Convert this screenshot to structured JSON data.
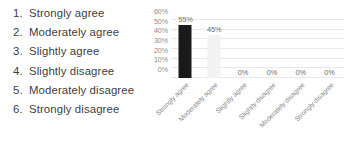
{
  "scale": {
    "items": [
      {
        "num": "1.",
        "label": "Strongly agree"
      },
      {
        "num": "2.",
        "label": "Moderately agree"
      },
      {
        "num": "3.",
        "label": "Slightly agree"
      },
      {
        "num": "4.",
        "label": "Slightly disagree"
      },
      {
        "num": "5.",
        "label": "Moderately disagree"
      },
      {
        "num": "6.",
        "label": "Strongly disagree"
      }
    ]
  },
  "chart_data": {
    "type": "bar",
    "title": "",
    "xlabel": "",
    "ylabel": "",
    "categories": [
      "Strongly agree",
      "Moderately agree",
      "Slightly agree",
      "Slightly disagree",
      "Moderately disagree",
      "Strongly disagree"
    ],
    "values": [
      55,
      45,
      0,
      0,
      0,
      0
    ],
    "data_labels": [
      "55%",
      "45%",
      "0%",
      "0%",
      "0%",
      "0%"
    ],
    "bar_colors": [
      "#1a1a1a",
      "#f2f2f2",
      "#f2f2f2",
      "#f2f2f2",
      "#f2f2f2",
      "#f2f2f2"
    ],
    "ylim": [
      0,
      60
    ],
    "yticks": [
      60,
      50,
      40,
      30,
      20,
      10,
      0
    ],
    "ytick_labels": [
      "60%",
      "50%",
      "40%",
      "30%",
      "20%",
      "10%",
      "0%"
    ],
    "grid": true,
    "grid_color": "#e8e8e8",
    "legend": "none",
    "xtick_rotation": -45
  }
}
